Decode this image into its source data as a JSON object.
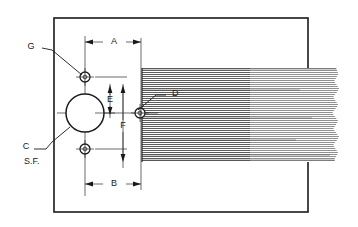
{
  "drawing": {
    "title": "Mechanical Part Section Drawing",
    "background_color": "#ffffff",
    "line_color": "#1a1a1a",
    "hatch_color": "#4a4a4a",
    "frame": {
      "x": 54,
      "y": 18,
      "width": 254,
      "height": 194
    },
    "callouts": [
      {
        "id": "G",
        "label": "G",
        "text_x": 34,
        "text_y": 47,
        "leader_from_x": 42,
        "leader_from_y": 48,
        "leader_to_x": 84,
        "leader_to_y": 77
      },
      {
        "id": "C",
        "label": "C",
        "text_x": 26,
        "text_y": 148,
        "leader_from_x": 34,
        "leader_from_y": 149,
        "leader_to_x": 68,
        "leader_to_y": 126
      },
      {
        "id": "SF",
        "label": "S.F.",
        "text_x": 24,
        "text_y": 162,
        "leader_from_x": 0,
        "leader_from_y": 0,
        "leader_to_x": 0,
        "leader_to_y": 0
      },
      {
        "id": "D",
        "label": "D",
        "text_x": 172,
        "text_y": 94,
        "leader_from_x": 168,
        "leader_from_y": 95,
        "leader_to_x": 140,
        "leader_to_y": 113
      }
    ],
    "dimensions": [
      {
        "id": "A",
        "label": "A",
        "orientation": "horizontal",
        "text_x": 114,
        "text_y": 42,
        "line_y": 42,
        "start_x": 85,
        "end_x": 141
      },
      {
        "id": "B",
        "label": "B",
        "orientation": "horizontal",
        "text_x": 114,
        "text_y": 184,
        "line_y": 184,
        "start_x": 85,
        "end_x": 141
      },
      {
        "id": "E",
        "label": "E",
        "orientation": "vertical",
        "text_x": 110,
        "text_y": 100,
        "line_x": 110,
        "start_y": 88,
        "end_y": 113
      },
      {
        "id": "F",
        "label": "F",
        "orientation": "vertical",
        "text_x": 123,
        "text_y": 126,
        "line_x": 123,
        "start_y": 88,
        "end_y": 163
      }
    ],
    "circles": {
      "main_bore": {
        "cx": 85,
        "cy": 113,
        "r": 19
      },
      "holes": [
        {
          "id": "upper-hole",
          "cx": 85,
          "cy": 77,
          "r": 5
        },
        {
          "id": "lower-hole",
          "cx": 85,
          "cy": 149,
          "r": 5
        },
        {
          "id": "section-hole",
          "cx": 140,
          "cy": 113,
          "r": 5
        }
      ]
    },
    "hatched_region": {
      "x": 142,
      "y": 68,
      "width": 200,
      "height": 94,
      "pattern": "horizontal-section-lines",
      "line_spacing": 2
    },
    "centerlines": {
      "vertical_x": 85,
      "horizontal_y": 113
    }
  }
}
